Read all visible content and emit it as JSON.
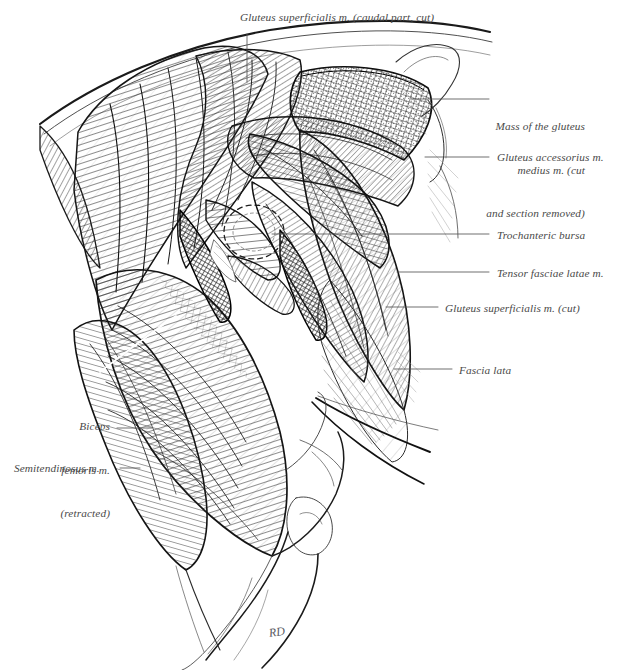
{
  "plate": {
    "title": "Dissection of the canine gluteal and hip region",
    "background_color": "#ffffff",
    "ink_color": "#1a1a1a",
    "label_color": "#4a4a4a",
    "leader_color": "#555555",
    "signature": "RD"
  },
  "labels": [
    {
      "id": "gluteus-superficialis-caudal",
      "text": "Gluteus superficialis m. (caudal part, cut)",
      "lines": [
        "Gluteus superficialis m. (caudal part, cut)"
      ],
      "align": "left",
      "x": 240,
      "y": 10,
      "leader": {
        "x1": 247,
        "y1": 34,
        "x2": 247,
        "y2": 82
      }
    },
    {
      "id": "mass-gluteus-medius",
      "text": "Mass of the gluteus medius m. (cut and section removed)",
      "lines": [
        "Mass of the gluteus",
        "medius m. (cut",
        "and section removed)"
      ],
      "align": "right",
      "x": 497,
      "y": 90,
      "leader": {
        "x1": 411,
        "y1": 99,
        "x2": 489,
        "y2": 99
      }
    },
    {
      "id": "gluteus-accessorius",
      "text": "Gluteus accessorius m.",
      "lines": [
        "Gluteus accessorius m."
      ],
      "align": "left",
      "x": 497,
      "y": 150,
      "leader": {
        "x1": 425,
        "y1": 157,
        "x2": 489,
        "y2": 157
      }
    },
    {
      "id": "trochanteric-bursa",
      "text": "Trochanteric bursa",
      "lines": [
        "Trochanteric bursa"
      ],
      "align": "left",
      "x": 497,
      "y": 228,
      "leader": {
        "x1": 272,
        "y1": 234,
        "x2": 489,
        "y2": 234
      }
    },
    {
      "id": "tensor-fasciae-latae",
      "text": "Tensor fasciae latae m.",
      "lines": [
        "Tensor fasciae latae m."
      ],
      "align": "left",
      "x": 497,
      "y": 266,
      "leader": {
        "x1": 397,
        "y1": 272,
        "x2": 489,
        "y2": 272
      }
    },
    {
      "id": "gluteus-superficialis-cut",
      "text": "Gluteus superficialis m. (cut)",
      "lines": [
        "Gluteus superficialis m. (cut)"
      ],
      "align": "left",
      "x": 445,
      "y": 301,
      "leader": {
        "x1": 386,
        "y1": 307,
        "x2": 438,
        "y2": 307
      }
    },
    {
      "id": "fascia-lata",
      "text": "Fascia lata",
      "lines": [
        "Fascia lata"
      ],
      "align": "left",
      "x": 459,
      "y": 363,
      "leader": {
        "x1": 394,
        "y1": 369,
        "x2": 452,
        "y2": 369
      }
    },
    {
      "id": "biceps-femoris-retracted",
      "text": "Biceps femoris m. (retracted)",
      "lines": [
        "Biceps",
        "femoris m.",
        "(retracted)"
      ],
      "align": "right",
      "x": 16,
      "y": 390,
      "width": 94,
      "leader": {
        "x1": 117,
        "y1": 428,
        "x2": 152,
        "y2": 428
      }
    },
    {
      "id": "semitendinosus",
      "text": "Semitendinosus m.",
      "lines": [
        "Semitendinosus m."
      ],
      "align": "left",
      "x": 14,
      "y": 461,
      "leader": {
        "x1": 120,
        "y1": 468,
        "x2": 140,
        "y2": 468
      }
    }
  ]
}
